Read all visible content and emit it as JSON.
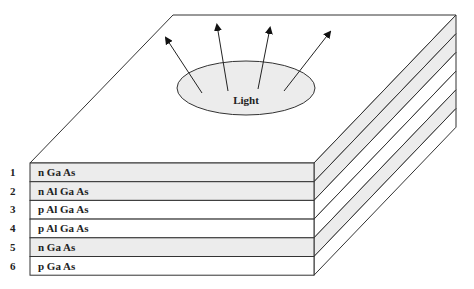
{
  "diagram": {
    "emission_label": "Light",
    "layers": [
      {
        "index": "1",
        "material": "n Ga As",
        "shaded": true
      },
      {
        "index": "2",
        "material": "n Al Ga As",
        "shaded": true
      },
      {
        "index": "3",
        "material": "p Al Ga As",
        "shaded": false
      },
      {
        "index": "4",
        "material": "p Al Ga As",
        "shaded": false
      },
      {
        "index": "5",
        "material": "n Ga As",
        "shaded": true
      },
      {
        "index": "6",
        "material": "p Ga As",
        "shaded": false
      }
    ],
    "colors": {
      "line": "#333333",
      "shade": "#ececec",
      "background": "#ffffff"
    }
  }
}
